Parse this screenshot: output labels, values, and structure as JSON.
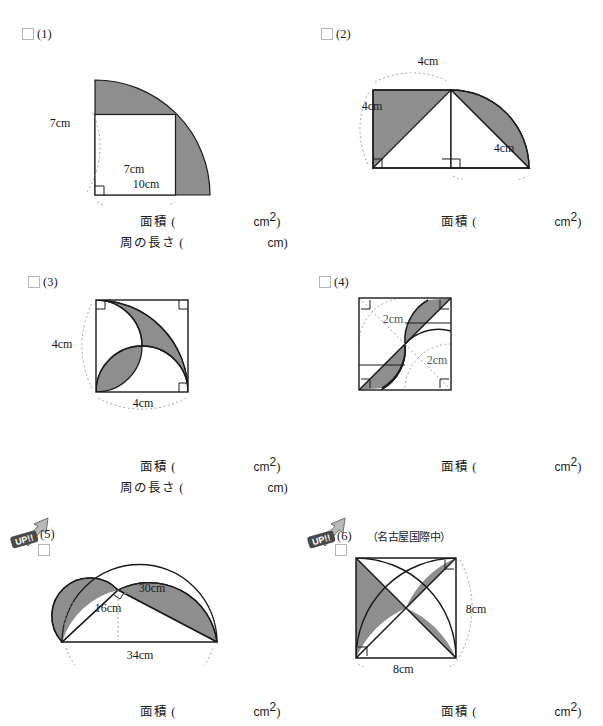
{
  "page": {
    "shaded_color": "#8e8e8e",
    "line_color": "#1a1a1a",
    "dotted_color": "#9a9a9a"
  },
  "labels": {
    "area": "面積",
    "perimeter": "周の長さ",
    "paren_open": "(",
    "paren_close": ")",
    "unit_cm": "cm",
    "unit_cm2_base": "cm",
    "unit_cm2_sup": "2",
    "up_badge": "UP!!"
  },
  "problems": [
    {
      "number": "(1)",
      "source": "",
      "badge": false,
      "answers": [
        {
          "label": "面積",
          "unit": "cm",
          "sup": "2"
        },
        {
          "label": "周の長さ",
          "unit": "cm",
          "sup": ""
        }
      ],
      "figure": {
        "type": "quarter-circle-minus-square",
        "dims": [
          {
            "text": "7cm",
            "x": 60,
            "y": 122
          },
          {
            "text": "7cm",
            "x": 122,
            "y": 172
          },
          {
            "text": "10cm",
            "x": 132,
            "y": 186
          }
        ]
      }
    },
    {
      "number": "(2)",
      "source": "",
      "badge": false,
      "answers": [
        {
          "label": "面積",
          "unit": "cm",
          "sup": "2"
        }
      ],
      "figure": {
        "type": "square-and-quarter-circle",
        "dims": [
          {
            "text": "4cm",
            "x": 427,
            "y": 63
          },
          {
            "text": "4cm",
            "x": 371,
            "y": 107
          },
          {
            "text": "4cm",
            "x": 503,
            "y": 150
          }
        ]
      }
    },
    {
      "number": "(3)",
      "source": "",
      "badge": false,
      "answers": [
        {
          "label": "面積",
          "unit": "cm",
          "sup": "2"
        },
        {
          "label": "周の長さ",
          "unit": "cm",
          "sup": ""
        }
      ],
      "figure": {
        "type": "square-two-arcs-lens",
        "dims": [
          {
            "text": "4cm",
            "x": 50,
            "y": 348
          },
          {
            "text": "4cm",
            "x": 135,
            "y": 406
          }
        ]
      }
    },
    {
      "number": "(4)",
      "source": "",
      "badge": false,
      "answers": [
        {
          "label": "面積",
          "unit": "cm",
          "sup": "2"
        }
      ],
      "figure": {
        "type": "square-pinwheel-arcs",
        "dims": [
          {
            "text": "2cm",
            "x": 392,
            "y": 319
          },
          {
            "text": "2cm",
            "x": 436,
            "y": 359
          }
        ]
      }
    },
    {
      "number": "(5)",
      "source": "",
      "badge": true,
      "answers": [
        {
          "label": "面積",
          "unit": "cm",
          "sup": "2"
        }
      ],
      "figure": {
        "type": "lunes-of-hippocrates",
        "dims": [
          {
            "text": "30cm",
            "x": 145,
            "y": 591
          },
          {
            "text": "16cm",
            "x": 100,
            "y": 611
          },
          {
            "text": "34cm",
            "x": 135,
            "y": 646
          }
        ]
      }
    },
    {
      "number": "(6)",
      "source": "（名古屋国際中）",
      "badge": true,
      "answers": [
        {
          "label": "面積",
          "unit": "cm",
          "sup": "2"
        }
      ],
      "figure": {
        "type": "square-diagonals-two-arcs",
        "dims": [
          {
            "text": "8cm",
            "x": 487,
            "y": 600
          },
          {
            "text": "8cm",
            "x": 412,
            "y": 664
          }
        ]
      }
    }
  ]
}
